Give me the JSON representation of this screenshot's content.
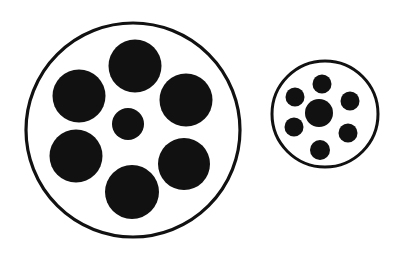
{
  "figure": {
    "background_color": "#ffffff",
    "ink_color": "#111111",
    "canvas": {
      "width": 400,
      "height": 256
    }
  },
  "chart_data": {
    "type": "scatter",
    "xlabel": "",
    "ylabel": "",
    "xlim": [
      0,
      400
    ],
    "ylim": [
      0,
      256
    ],
    "grid": false,
    "legend": "none",
    "annotations": [],
    "groups": [
      {
        "name": "large-group",
        "outline": {
          "name": "large-outline-circle",
          "cx": 133,
          "cy": 130,
          "r": 107,
          "stroke_width": 3.2,
          "stroke": "#111111",
          "fill": "#ffffff"
        },
        "center_dot": {
          "name": "large-center-dot",
          "cx": 128,
          "cy": 124,
          "r": 16,
          "fill": "#111111"
        },
        "surrounding_dots": [
          {
            "name": "large-dot-top",
            "cx": 135,
            "cy": 66,
            "r": 26.5,
            "fill": "#111111"
          },
          {
            "name": "large-dot-upper-left",
            "cx": 79,
            "cy": 96,
            "r": 26.5,
            "fill": "#111111"
          },
          {
            "name": "large-dot-upper-right",
            "cx": 186,
            "cy": 100,
            "r": 26.5,
            "fill": "#111111"
          },
          {
            "name": "large-dot-lower-left",
            "cx": 76,
            "cy": 156,
            "r": 26.5,
            "fill": "#111111"
          },
          {
            "name": "large-dot-lower-right",
            "cx": 184,
            "cy": 164,
            "r": 26.0,
            "fill": "#111111"
          },
          {
            "name": "large-dot-bottom",
            "cx": 132,
            "cy": 192,
            "r": 27.0,
            "fill": "#111111"
          }
        ]
      },
      {
        "name": "small-group",
        "outline": {
          "name": "small-outline-circle",
          "cx": 325,
          "cy": 114,
          "r": 53,
          "stroke_width": 3.0,
          "stroke": "#111111",
          "fill": "#ffffff"
        },
        "center_dot": {
          "name": "small-center-dot",
          "cx": 319,
          "cy": 113,
          "r": 14,
          "fill": "#111111"
        },
        "surrounding_dots": [
          {
            "name": "small-dot-top",
            "cx": 322,
            "cy": 84,
            "r": 9.5,
            "fill": "#111111"
          },
          {
            "name": "small-dot-upper-left",
            "cx": 295,
            "cy": 97,
            "r": 9.5,
            "fill": "#111111"
          },
          {
            "name": "small-dot-upper-right",
            "cx": 350,
            "cy": 101,
            "r": 9.5,
            "fill": "#111111"
          },
          {
            "name": "small-dot-lower-left",
            "cx": 294,
            "cy": 127,
            "r": 9.5,
            "fill": "#111111"
          },
          {
            "name": "small-dot-lower-right",
            "cx": 348,
            "cy": 133,
            "r": 9.5,
            "fill": "#111111"
          },
          {
            "name": "small-dot-bottom",
            "cx": 320,
            "cy": 150,
            "r": 10.0,
            "fill": "#111111"
          }
        ]
      }
    ]
  }
}
